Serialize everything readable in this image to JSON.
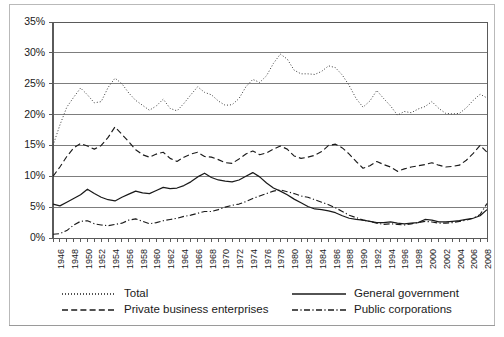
{
  "chart_data": {
    "type": "line",
    "title": "",
    "subtitle": "",
    "xlabel": "",
    "ylabel": "",
    "grid": true,
    "legend_position": "bottom",
    "xlim": [
      1946,
      2009
    ],
    "ylim": [
      0,
      35
    ],
    "ytick_labels": [
      "0%",
      "5%",
      "10%",
      "15%",
      "20%",
      "25%",
      "30%",
      "35%"
    ],
    "ytick_values": [
      0,
      5,
      10,
      15,
      20,
      25,
      30,
      35
    ],
    "xtick_labels": [
      "1946",
      "1948",
      "1950",
      "1952",
      "1954",
      "1956",
      "1958",
      "1960",
      "1962",
      "1964",
      "1966",
      "1968",
      "1970",
      "1972",
      "1974",
      "1976",
      "1978",
      "1980",
      "1982",
      "1984",
      "1986",
      "1988",
      "1990",
      "1992",
      "1994",
      "1996",
      "1998",
      "2000",
      "2002",
      "2004",
      "2006",
      "2008"
    ],
    "x": [
      1946,
      1947,
      1948,
      1949,
      1950,
      1951,
      1952,
      1953,
      1954,
      1955,
      1956,
      1957,
      1958,
      1959,
      1960,
      1961,
      1962,
      1963,
      1964,
      1965,
      1966,
      1967,
      1968,
      1969,
      1970,
      1971,
      1972,
      1973,
      1974,
      1975,
      1976,
      1977,
      1978,
      1979,
      1980,
      1981,
      1982,
      1983,
      1984,
      1985,
      1986,
      1987,
      1988,
      1989,
      1990,
      1991,
      1992,
      1993,
      1994,
      1995,
      1996,
      1997,
      1998,
      1999,
      2000,
      2001,
      2002,
      2003,
      2004,
      2005,
      2006,
      2007,
      2008,
      2009
    ],
    "series": [
      {
        "name": "Total",
        "style": "dotted",
        "color": "#3a3a3a",
        "values": [
          15.0,
          18.3,
          21.2,
          22.8,
          24.3,
          23.2,
          21.9,
          22.1,
          24.4,
          25.9,
          25.0,
          23.5,
          22.3,
          21.5,
          20.7,
          21.4,
          22.5,
          21.0,
          20.6,
          21.8,
          23.2,
          24.5,
          23.6,
          23.2,
          22.2,
          21.5,
          21.6,
          22.6,
          24.5,
          25.7,
          25.2,
          26.3,
          28.3,
          29.8,
          29.0,
          27.2,
          26.6,
          26.6,
          26.5,
          27.0,
          27.9,
          27.6,
          26.4,
          24.7,
          22.6,
          21.2,
          22.2,
          23.9,
          22.6,
          21.4,
          19.9,
          20.5,
          20.3,
          20.9,
          21.3,
          22.1,
          21.0,
          20.2,
          20.1,
          20.2,
          21.1,
          22.3,
          23.3,
          22.7
        ]
      },
      {
        "name": "Private business enterprises",
        "style": "dashed",
        "color": "#1a1a1a",
        "values": [
          10.0,
          11.5,
          13.2,
          14.6,
          15.3,
          14.9,
          14.4,
          15.0,
          16.3,
          18.0,
          16.8,
          15.6,
          14.3,
          13.5,
          13.1,
          13.6,
          13.9,
          12.9,
          12.4,
          13.1,
          13.6,
          13.9,
          13.2,
          13.1,
          12.7,
          12.2,
          12.1,
          12.8,
          13.6,
          14.1,
          13.5,
          13.8,
          14.4,
          14.9,
          14.4,
          13.3,
          12.9,
          13.1,
          13.4,
          14.0,
          15.0,
          15.2,
          14.6,
          13.6,
          12.4,
          11.3,
          11.7,
          12.4,
          11.9,
          11.5,
          10.8,
          11.2,
          11.5,
          11.7,
          11.9,
          12.2,
          11.8,
          11.5,
          11.6,
          11.8,
          12.6,
          13.7,
          15.0,
          13.9
        ]
      },
      {
        "name": "General government",
        "style": "solid",
        "color": "#1a1a1a",
        "values": [
          5.5,
          5.2,
          5.8,
          6.4,
          7.0,
          7.9,
          7.2,
          6.6,
          6.2,
          6.0,
          6.6,
          7.1,
          7.6,
          7.3,
          7.2,
          7.7,
          8.2,
          8.0,
          8.1,
          8.5,
          9.1,
          9.9,
          10.5,
          9.8,
          9.4,
          9.2,
          9.1,
          9.4,
          10.0,
          10.6,
          9.9,
          8.9,
          8.1,
          7.6,
          7.0,
          6.3,
          5.7,
          5.1,
          4.7,
          4.6,
          4.4,
          4.1,
          3.6,
          3.2,
          3.0,
          2.9,
          2.7,
          2.5,
          2.5,
          2.6,
          2.4,
          2.3,
          2.4,
          2.5,
          3.0,
          2.9,
          2.6,
          2.6,
          2.7,
          2.8,
          3.0,
          3.2,
          3.6,
          4.6
        ]
      },
      {
        "name": "Public corporations",
        "style": "dashdot",
        "color": "#1a1a1a",
        "values": [
          0.6,
          0.7,
          1.2,
          2.1,
          2.7,
          2.8,
          2.3,
          2.1,
          2.0,
          2.2,
          2.4,
          2.9,
          3.1,
          2.7,
          2.3,
          2.5,
          2.8,
          3.0,
          3.2,
          3.5,
          3.7,
          4.0,
          4.3,
          4.3,
          4.6,
          5.0,
          5.3,
          5.5,
          5.9,
          6.4,
          6.8,
          7.2,
          7.6,
          7.8,
          7.5,
          7.2,
          6.8,
          6.6,
          6.2,
          5.8,
          5.4,
          4.9,
          4.3,
          3.7,
          3.3,
          2.9,
          2.7,
          2.4,
          2.2,
          2.3,
          2.2,
          2.1,
          2.3,
          2.5,
          2.7,
          2.6,
          2.4,
          2.4,
          2.5,
          2.7,
          2.9,
          3.2,
          3.8,
          5.6
        ]
      }
    ],
    "legend": [
      {
        "label": "Total",
        "style": "dotted"
      },
      {
        "label": "General government",
        "style": "solid"
      },
      {
        "label": "Private business enterprises",
        "style": "dashed"
      },
      {
        "label": "Public corporations",
        "style": "dashdot"
      }
    ]
  },
  "colors": {
    "axis": "#5a5a5a",
    "grid": "#7d7d7d",
    "frame": "#b9b9b9",
    "text": "#1a1a1a"
  }
}
